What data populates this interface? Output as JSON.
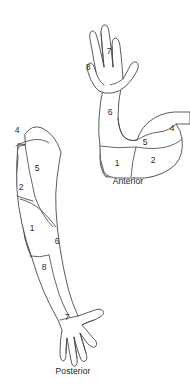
{
  "figure": {
    "background_color": "#ffffff",
    "outline_color": "#4a4a4a",
    "shade_color": "#c9c9c9",
    "shade_color_dark": "#b6b6b6",
    "label_color": "#2b2b2b"
  },
  "views": [
    {
      "id": "anterior",
      "caption": "Anterior",
      "caption_x": 128,
      "caption_y": 182,
      "labels": [
        {
          "text": "7",
          "x": 109,
          "y": 52
        },
        {
          "text": "8",
          "x": 88,
          "y": 68
        },
        {
          "text": "6",
          "x": 110,
          "y": 113
        },
        {
          "text": "5",
          "x": 145,
          "y": 143
        },
        {
          "text": "4",
          "x": 172,
          "y": 129
        },
        {
          "text": "1",
          "x": 117,
          "y": 164
        },
        {
          "text": "2",
          "x": 153,
          "y": 161
        }
      ]
    },
    {
      "id": "posterior",
      "caption": "Posterior",
      "caption_x": 73,
      "caption_y": 372,
      "labels": [
        {
          "text": "4",
          "x": 17,
          "y": 131
        },
        {
          "text": "5",
          "x": 37,
          "y": 169
        },
        {
          "text": "2",
          "x": 21,
          "y": 188
        },
        {
          "text": "1",
          "x": 32,
          "y": 229
        },
        {
          "text": "6",
          "x": 57,
          "y": 242
        },
        {
          "text": "8",
          "x": 44,
          "y": 268
        },
        {
          "text": "7",
          "x": 67,
          "y": 318
        }
      ]
    }
  ],
  "legend_numbers": [
    "1",
    "2",
    "4",
    "5",
    "6",
    "7",
    "8"
  ]
}
